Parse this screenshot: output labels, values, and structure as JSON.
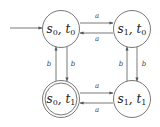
{
  "diagram": {
    "type": "finite-automaton-product",
    "colors": {
      "stroke": "#555555",
      "text": "#222222",
      "background": "#ffffff"
    },
    "initial_state": "s0t0",
    "nodes": [
      {
        "id": "s0t0",
        "s": "s",
        "s_sub": "0",
        "t": "t",
        "t_sub": "0",
        "cx": 61,
        "cy": 29,
        "accepting": false
      },
      {
        "id": "s1t0",
        "s": "s",
        "s_sub": "1",
        "t": "t",
        "t_sub": "0",
        "cx": 132,
        "cy": 29,
        "accepting": false
      },
      {
        "id": "s0t1",
        "s": "s",
        "s_sub": "0",
        "t": "t",
        "t_sub": "1",
        "cx": 61,
        "cy": 99,
        "accepting": true
      },
      {
        "id": "s1t1",
        "s": "s",
        "s_sub": "1",
        "t": "t",
        "t_sub": "1",
        "cx": 132,
        "cy": 99,
        "accepting": false
      }
    ],
    "edges": [
      {
        "from": "s0t0",
        "to": "s1t0",
        "label": "a"
      },
      {
        "from": "s1t0",
        "to": "s0t0",
        "label": "a"
      },
      {
        "from": "s0t1",
        "to": "s1t1",
        "label": "a"
      },
      {
        "from": "s1t1",
        "to": "s0t1",
        "label": "a"
      },
      {
        "from": "s0t0",
        "to": "s0t1",
        "label": "b"
      },
      {
        "from": "s0t1",
        "to": "s0t0",
        "label": "b"
      },
      {
        "from": "s1t0",
        "to": "s1t1",
        "label": "b"
      },
      {
        "from": "s1t1",
        "to": "s1t0",
        "label": "b"
      }
    ]
  }
}
